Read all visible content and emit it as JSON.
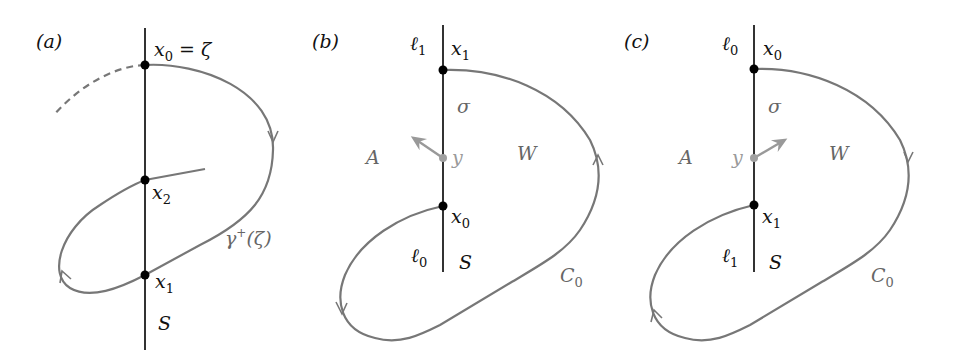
{
  "figure": {
    "panels": [
      {
        "id": "a",
        "label": "(a)",
        "line_label": "S",
        "points": [
          {
            "name": "x",
            "sub": "0",
            "suffix": " = ζ"
          },
          {
            "name": "x",
            "sub": "2",
            "suffix": ""
          },
          {
            "name": "x",
            "sub": "1",
            "suffix": ""
          }
        ],
        "curve_label": {
          "name": "γ",
          "sup": "+",
          "suffix": "(ζ)"
        }
      },
      {
        "id": "b",
        "label": "(b)",
        "line_label": "S",
        "segment_top": {
          "name": "ℓ",
          "sub": "1"
        },
        "segment_bottom": {
          "name": "ℓ",
          "sub": "0"
        },
        "points": [
          {
            "name": "x",
            "sub": "1"
          },
          {
            "name": "x",
            "sub": "0"
          }
        ],
        "arc_label": "σ",
        "mid_point": "y",
        "region_left": "A",
        "region_right": "W",
        "curve_label": {
          "name": "C",
          "sub": "0"
        }
      },
      {
        "id": "c",
        "label": "(c)",
        "line_label": "S",
        "segment_top": {
          "name": "ℓ",
          "sub": "0"
        },
        "segment_bottom": {
          "name": "ℓ",
          "sub": "1"
        },
        "points": [
          {
            "name": "x",
            "sub": "0"
          },
          {
            "name": "x",
            "sub": "1"
          }
        ],
        "arc_label": "σ",
        "mid_point": "y",
        "region_left": "A",
        "region_right": "W",
        "curve_label": {
          "name": "C",
          "sub": "0"
        }
      }
    ],
    "colors": {
      "line": "#333333",
      "curve": "#777777",
      "point": "#000000",
      "mid_point": "#a0a0a0",
      "arrow": "#999999"
    }
  }
}
